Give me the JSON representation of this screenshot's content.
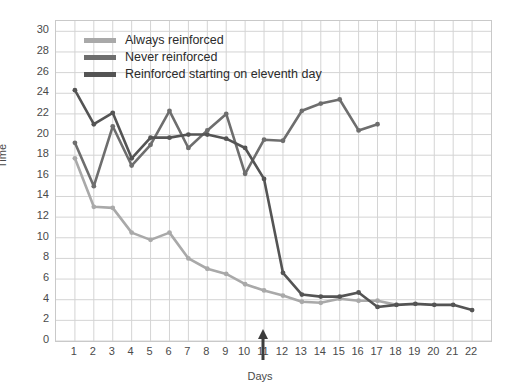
{
  "chart_data": {
    "type": "line",
    "title": "",
    "xlabel": "Days",
    "ylabel": "Time",
    "xlim": [
      0,
      23
    ],
    "ylim": [
      0,
      31
    ],
    "yticks": [
      0,
      2,
      4,
      6,
      8,
      10,
      12,
      14,
      16,
      18,
      20,
      22,
      24,
      26,
      28,
      30
    ],
    "xticks": [
      1,
      2,
      3,
      4,
      5,
      6,
      7,
      8,
      9,
      10,
      11,
      12,
      13,
      14,
      15,
      16,
      17,
      18,
      19,
      20,
      21,
      22
    ],
    "grid": true,
    "legend_position": "top-left",
    "annotations": [
      {
        "name": "day-11-arrow",
        "x": 11,
        "label": ""
      }
    ],
    "series": [
      {
        "name": "Always reinforced",
        "color": "#a9a9a9",
        "x": [
          1,
          2,
          3,
          4,
          5,
          6,
          7,
          8,
          9,
          10,
          11,
          12,
          13,
          14,
          15,
          16,
          17,
          18
        ],
        "values": [
          17.7,
          13.0,
          12.9,
          10.5,
          9.8,
          10.5,
          8.0,
          7.0,
          6.5,
          5.5,
          4.9,
          4.4,
          3.8,
          3.7,
          4.1,
          3.9,
          3.9,
          3.5
        ]
      },
      {
        "name": "Never reinforced",
        "color": "#6e6e6e",
        "x": [
          1,
          2,
          3,
          4,
          5,
          6,
          7,
          8,
          9,
          10,
          11,
          12,
          13,
          14,
          15,
          16,
          17
        ],
        "values": [
          19.2,
          15.0,
          20.8,
          17.0,
          19.0,
          22.3,
          18.7,
          20.4,
          22.0,
          16.2,
          19.5,
          19.4,
          22.3,
          23.0,
          23.4,
          20.4,
          21.0
        ]
      },
      {
        "name": "Reinforced starting on eleventh day",
        "color": "#545454",
        "x": [
          1,
          2,
          3,
          4,
          5,
          6,
          7,
          8,
          9,
          10,
          11,
          12,
          13,
          14,
          15,
          16,
          17,
          18,
          19,
          20,
          21,
          22
        ],
        "values": [
          24.3,
          21.0,
          22.1,
          17.7,
          19.7,
          19.7,
          20.0,
          20.0,
          19.6,
          18.7,
          15.7,
          6.6,
          4.5,
          4.3,
          4.3,
          4.7,
          3.3,
          3.5,
          3.6,
          3.5,
          3.5,
          3.0
        ]
      }
    ]
  },
  "legend": {
    "items": [
      {
        "label": "Always reinforced",
        "color": "#a9a9a9"
      },
      {
        "label": "Never reinforced",
        "color": "#6e6e6e"
      },
      {
        "label": "Reinforced starting on eleventh day",
        "color": "#545454"
      }
    ]
  },
  "axes": {
    "y_title": "Time",
    "x_title": "Days"
  }
}
